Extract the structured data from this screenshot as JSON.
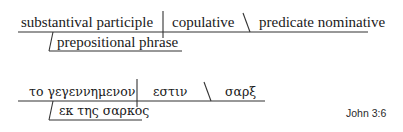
{
  "diagram": {
    "type": "sentence-diagram",
    "line_color": "#333333",
    "template": {
      "subject": "substantival participle",
      "verb": "copulative",
      "predicate": "predicate nominative",
      "modifier": "prepositional phrase"
    },
    "example": {
      "subject": "το γεγεννημενον",
      "verb": "εστιν",
      "predicate": "σαρξ",
      "modifier": "εκ της σαρκος"
    },
    "reference": "John 3:6"
  }
}
